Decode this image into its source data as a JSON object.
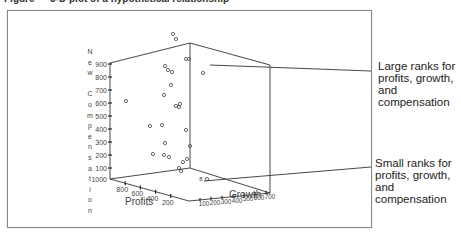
{
  "figure": {
    "title": "Figure — 3-D plot of a hypothetical relationship"
  },
  "chart_data": {
    "type": "scatter",
    "subtype": "3d-scatter",
    "title": "",
    "axes": {
      "x": {
        "label": "Profits",
        "ticks": [
          "1000",
          "800",
          "600",
          "400",
          "200"
        ],
        "range": [
          0,
          1000
        ]
      },
      "y": {
        "label": "Growth",
        "ticks": [
          "100",
          "200",
          "300",
          "400",
          "500",
          "600",
          "700"
        ],
        "range": [
          0,
          700
        ]
      },
      "z": {
        "label": "New Compensation",
        "ticks": [
          "1000",
          "900",
          "800",
          "700",
          "600",
          "500",
          "400",
          "300",
          "200",
          "100"
        ],
        "range": [
          0,
          1000
        ],
        "note": "axis runs 1000 at bottom to 100 at top as printed"
      }
    },
    "ylabel_letters": [
      "N",
      "e",
      "w",
      " ",
      "C",
      "o",
      "m",
      "p",
      "e",
      "n",
      "s",
      "a",
      "t",
      "i",
      "o",
      "n"
    ],
    "points_px": [
      [
        173,
        34
      ],
      [
        176,
        39
      ],
      [
        186,
        59
      ],
      [
        189,
        59
      ],
      [
        165,
        66
      ],
      [
        168,
        70
      ],
      [
        172,
        72
      ],
      [
        203,
        73
      ],
      [
        171,
        85
      ],
      [
        164,
        95
      ],
      [
        126,
        101
      ],
      [
        180,
        104
      ],
      [
        176,
        106
      ],
      [
        179,
        107
      ],
      [
        150,
        126
      ],
      [
        162,
        125
      ],
      [
        186,
        130
      ],
      [
        165,
        143
      ],
      [
        190,
        146
      ],
      [
        164,
        155
      ],
      [
        169,
        157
      ],
      [
        153,
        154
      ],
      [
        183,
        162
      ],
      [
        179,
        168
      ],
      [
        181,
        171
      ],
      [
        207,
        179
      ],
      [
        187,
        159
      ]
    ],
    "annotations": [
      {
        "text": "Large ranks for profits, growth, and compensation",
        "target": "upper point cluster"
      },
      {
        "text": "Small ranks for profits, growth, and compensation",
        "target": "lower corner point"
      }
    ],
    "grid": false,
    "legend": null
  },
  "callouts": {
    "large": [
      "Large ranks for",
      "profits, growth,",
      "and",
      "compensation"
    ],
    "small": [
      "Small ranks for",
      "profits, growth,",
      "and",
      "compensation"
    ]
  },
  "axis_labels": {
    "profits": "Profits",
    "growth": "Growth"
  },
  "z_ticks": [
    "900",
    "800",
    "700",
    "600",
    "500",
    "400",
    "300",
    "200",
    "100"
  ],
  "corner_tick": "1000",
  "profit_ticks": [
    "800",
    "600",
    "400",
    "200"
  ],
  "growth_ticks": [
    "100",
    "200",
    "300",
    "400",
    "500",
    "600",
    "700"
  ],
  "stray_mark": "8"
}
